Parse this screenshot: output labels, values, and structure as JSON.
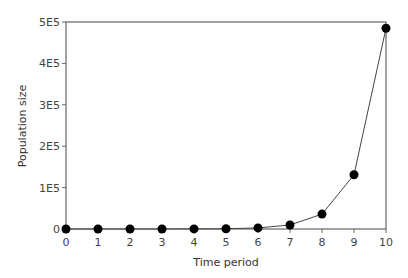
{
  "chart_data": {
    "type": "line",
    "title": "",
    "xlabel": "Time period",
    "ylabel": "Population size",
    "x": [
      0,
      1,
      2,
      3,
      4,
      5,
      6,
      7,
      8,
      9,
      10
    ],
    "series": [
      {
        "name": "Population size",
        "values": [
          1,
          4,
          14,
          51,
          190,
          700,
          2600,
          9700,
          36000,
          131000,
          485000
        ],
        "marker": "filled-circle",
        "color": "#000000"
      }
    ],
    "x_ticks": [
      "0",
      "1",
      "2",
      "3",
      "4",
      "5",
      "6",
      "7",
      "8",
      "9",
      "10"
    ],
    "y_ticks": [
      "0",
      "1E5",
      "2E5",
      "3E5",
      "4E5",
      "5E5"
    ],
    "xlim": [
      0,
      10
    ],
    "ylim": [
      0,
      500000
    ],
    "grid": false,
    "legend": null
  }
}
